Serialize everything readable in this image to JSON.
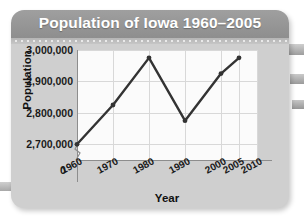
{
  "card": {
    "title": "Population of Iowa 1960–2005"
  },
  "chart_data": {
    "type": "line",
    "title": "Population of Iowa 1960–2005",
    "xlabel": "Year",
    "ylabel": "Population",
    "x": [
      1960,
      1970,
      1980,
      1990,
      2000,
      2005
    ],
    "values": [
      2700000,
      2825000,
      2975000,
      2775000,
      2925000,
      2975000
    ],
    "series": [
      {
        "name": "Population of Iowa",
        "values": [
          2700000,
          2825000,
          2975000,
          2775000,
          2925000,
          2975000
        ]
      }
    ],
    "x_tick_labels": [
      "1960",
      "1970",
      "1980",
      "1990",
      "2000",
      "2005",
      "2010"
    ],
    "x_tick_values": [
      1960,
      1970,
      1980,
      1990,
      2000,
      2005,
      2010
    ],
    "y_tick_labels": [
      "2,700,000",
      "2,800,000",
      "2,900,000",
      "3,000,000"
    ],
    "y_tick_values": [
      2700000,
      2800000,
      2900000,
      3000000
    ],
    "origin_label": "0",
    "xlim": [
      1960,
      2010
    ],
    "ylim": [
      2650000,
      3000000
    ],
    "axis_break": true,
    "grid": true,
    "legend": "none",
    "line_color": "#333333",
    "marker": "circle",
    "plot_background": "#fbfbfb"
  },
  "style": {
    "header_color": "#8e8e8e",
    "card_color": "#cfcfcf",
    "title_color": "#ffffff",
    "grid_color": "#d8d8d8"
  }
}
